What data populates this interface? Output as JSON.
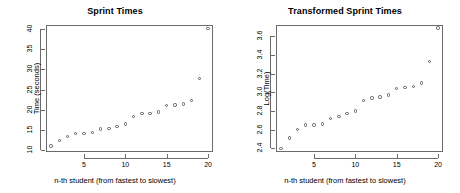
{
  "figure": {
    "background": "#ffffff",
    "point_color": "#5a5a5a",
    "axis_color": "#6b6b6b"
  },
  "panels": [
    {
      "id": "sprint-times",
      "title": "Sprint Times",
      "xlabel": "n-th student (from fastest to slowest)",
      "ylabel": "Time (seconds)"
    },
    {
      "id": "transformed-sprint-times",
      "title": "Transformed Sprint Times",
      "xlabel": "n-th student (from fastest to slowest)",
      "ylabel": "Log(Time)"
    }
  ],
  "chart_data": [
    {
      "type": "scatter",
      "title": "Sprint Times",
      "xlabel": "n-th student (from fastest to slowest)",
      "ylabel": "Time (seconds)",
      "xlim": [
        0.4,
        20.6
      ],
      "ylim": [
        9.5,
        41.0
      ],
      "xticks": [
        5,
        10,
        15,
        20
      ],
      "yticks": [
        10,
        15,
        20,
        25,
        30,
        35,
        40
      ],
      "grid": false,
      "legend": null,
      "marker": "open-circle",
      "x": [
        1,
        2,
        3,
        4,
        5,
        6,
        7,
        8,
        9,
        10,
        11,
        12,
        13,
        14,
        15,
        16,
        17,
        18,
        19,
        20
      ],
      "values": [
        11.0,
        12.3,
        13.4,
        14.1,
        14.1,
        14.3,
        15.2,
        15.4,
        15.9,
        16.4,
        18.3,
        19.0,
        19.1,
        19.4,
        21.0,
        21.2,
        21.4,
        22.3,
        27.8,
        40.2
      ]
    },
    {
      "type": "scatter",
      "title": "Transformed Sprint Times",
      "xlabel": "n-th student (from fastest to slowest)",
      "ylabel": "Log(Time)",
      "xlim": [
        0.4,
        20.6
      ],
      "ylim": [
        2.36,
        3.72
      ],
      "xticks": [
        5,
        10,
        15,
        20
      ],
      "yticks": [
        2.4,
        2.6,
        2.8,
        3.0,
        3.2,
        3.4,
        3.6
      ],
      "grid": false,
      "legend": null,
      "marker": "open-circle",
      "x": [
        1,
        2,
        3,
        4,
        5,
        6,
        7,
        8,
        9,
        10,
        11,
        12,
        13,
        14,
        15,
        16,
        17,
        18,
        19,
        20
      ],
      "values": [
        2.4,
        2.51,
        2.6,
        2.65,
        2.65,
        2.66,
        2.72,
        2.74,
        2.77,
        2.8,
        2.91,
        2.94,
        2.95,
        2.97,
        3.04,
        3.05,
        3.06,
        3.1,
        3.33,
        3.69
      ]
    }
  ]
}
